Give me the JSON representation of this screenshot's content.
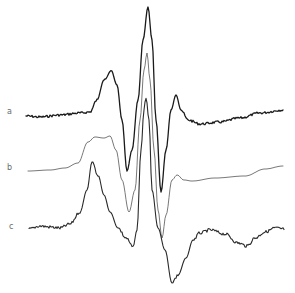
{
  "figure": {
    "type": "spectra-stack",
    "labels": {
      "a": "a",
      "b": "b",
      "c": "c"
    },
    "colors": {
      "trace_a": "#1a1a1a",
      "trace_b": "#555555",
      "trace_c": "#2a2a2a",
      "label": "#6a6a6a"
    }
  },
  "chart_data": {
    "type": "line",
    "title": "",
    "xlabel": "",
    "ylabel": "",
    "grid": false,
    "legend": "inline labels at left (a, b, c)",
    "series": [
      {
        "name": "a",
        "points_px": [
          [
            26,
            116
          ],
          [
            40,
            117
          ],
          [
            60,
            115
          ],
          [
            80,
            113
          ],
          [
            90,
            112
          ],
          [
            97,
            100
          ],
          [
            104,
            80
          ],
          [
            111,
            70
          ],
          [
            117,
            85
          ],
          [
            122,
            120
          ],
          [
            127,
            171
          ],
          [
            132,
            150
          ],
          [
            138,
            100
          ],
          [
            143,
            40
          ],
          [
            148,
            7
          ],
          [
            152,
            40
          ],
          [
            156,
            120
          ],
          [
            161,
            192
          ],
          [
            166,
            150
          ],
          [
            171,
            110
          ],
          [
            176,
            95
          ],
          [
            181,
            110
          ],
          [
            188,
            120
          ],
          [
            200,
            124
          ],
          [
            220,
            122
          ],
          [
            240,
            118
          ],
          [
            260,
            113
          ],
          [
            283,
            110
          ]
        ]
      },
      {
        "name": "b",
        "points_px": [
          [
            28,
            171
          ],
          [
            50,
            170
          ],
          [
            65,
            168
          ],
          [
            78,
            163
          ],
          [
            88,
            142
          ],
          [
            95,
            137
          ],
          [
            104,
            138
          ],
          [
            110,
            136
          ],
          [
            116,
            150
          ],
          [
            122,
            180
          ],
          [
            129,
            212
          ],
          [
            135,
            190
          ],
          [
            140,
            120
          ],
          [
            144,
            70
          ],
          [
            147,
            53
          ],
          [
            150,
            80
          ],
          [
            154,
            150
          ],
          [
            158,
            210
          ],
          [
            162,
            238
          ],
          [
            166,
            215
          ],
          [
            172,
            180
          ],
          [
            177,
            175
          ],
          [
            184,
            180
          ],
          [
            192,
            181
          ],
          [
            215,
            178
          ],
          [
            245,
            176
          ],
          [
            265,
            169
          ],
          [
            283,
            166
          ]
        ]
      },
      {
        "name": "c",
        "points_px": [
          [
            29,
            229
          ],
          [
            40,
            226
          ],
          [
            50,
            227
          ],
          [
            60,
            228
          ],
          [
            70,
            224
          ],
          [
            80,
            212
          ],
          [
            87,
            190
          ],
          [
            92,
            162
          ],
          [
            98,
            175
          ],
          [
            104,
            195
          ],
          [
            110,
            212
          ],
          [
            118,
            228
          ],
          [
            126,
            238
          ],
          [
            133,
            247
          ],
          [
            137,
            230
          ],
          [
            141,
            150
          ],
          [
            144,
            110
          ],
          [
            146,
            97
          ],
          [
            149,
            120
          ],
          [
            152,
            190
          ],
          [
            158,
            228
          ],
          [
            165,
            250
          ],
          [
            172,
            283
          ],
          [
            178,
            275
          ],
          [
            186,
            258
          ],
          [
            193,
            240
          ],
          [
            200,
            233
          ],
          [
            210,
            230
          ],
          [
            225,
            234
          ],
          [
            238,
            243
          ],
          [
            247,
            246
          ],
          [
            255,
            238
          ],
          [
            265,
            232
          ],
          [
            275,
            228
          ],
          [
            284,
            229
          ]
        ]
      }
    ]
  }
}
